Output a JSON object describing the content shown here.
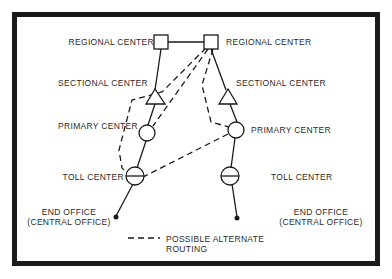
{
  "diagram": {
    "nodes": {
      "regional_left": "REGIONAL CENTER",
      "regional_right": "REGIONAL CENTER",
      "sectional_left": "SECTIONAL CENTER",
      "sectional_right": "SECTIONAL CENTER",
      "primary_left": "PRIMARY CENTER",
      "primary_right": "PRIMARY CENTER",
      "toll_left": "TOLL CENTER",
      "toll_right": "TOLL CENTER",
      "end_left_line1": "END OFFICE",
      "end_left_line2": "(CENTRAL OFFICE)",
      "end_right_line1": "END OFFICE",
      "end_right_line2": "(CENTRAL OFFICE)"
    },
    "legend": {
      "dashed_line1": "POSSIBLE ALTERNATE",
      "dashed_line2": "ROUTING"
    },
    "colors": {
      "ink": "#1a1a1a",
      "background": "#ffffff"
    }
  }
}
